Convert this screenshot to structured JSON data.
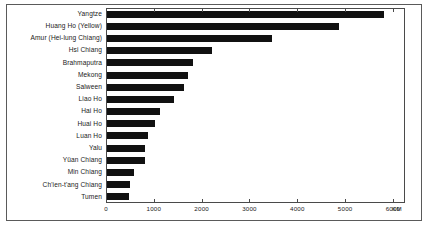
{
  "chart_data": {
    "type": "bar",
    "orientation": "horizontal",
    "title": "",
    "xlabel": "KM",
    "ylabel": "",
    "xlim": [
      0,
      6230
    ],
    "xticks": [
      0,
      1000,
      2000,
      3000,
      4000,
      5000,
      6000
    ],
    "xtick_labels": [
      "0",
      "1000",
      "2000",
      "3000",
      "4000",
      "5000",
      "6000"
    ],
    "unit": "KM",
    "grid": false,
    "legend": null,
    "bar_color": "#111111",
    "categories": [
      "Yangtze",
      "Huang Ho (Yellow)",
      "Amur (Hei-lung Chiang)",
      "Hsi Chiang",
      "Brahmaputra",
      "Mekong",
      "Salween",
      "Liao Ho",
      "Hai Ho",
      "Huai Ho",
      "Luan Ho",
      "Yalu",
      "Yüan Chiang",
      "Min Chiang",
      "Ch'ien-t'ang Chiang",
      "Tumen"
    ],
    "values": [
      5800,
      4850,
      3450,
      2200,
      1800,
      1700,
      1600,
      1400,
      1100,
      1000,
      850,
      790,
      800,
      560,
      480,
      470
    ]
  },
  "axis": {
    "unit_label": "KM"
  }
}
